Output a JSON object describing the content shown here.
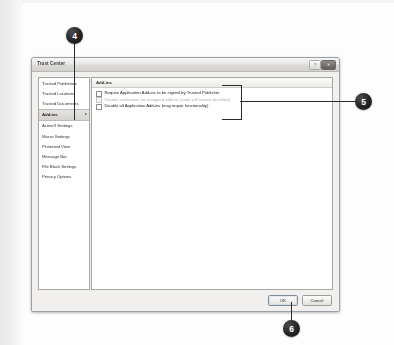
{
  "page": {
    "background_color": "#fdfdfd",
    "margin_band_color": "#e8e8e8"
  },
  "dialog": {
    "title": "Trust Center",
    "title_bar": {
      "help_button_label": "?",
      "close_button_label": "✕"
    },
    "sidebar": {
      "items": [
        {
          "label": "Trusted Publishers",
          "selected": false
        },
        {
          "label": "Trusted Locations",
          "selected": false
        },
        {
          "label": "Trusted Documents",
          "selected": false
        },
        {
          "label": "Add-ins",
          "selected": true
        },
        {
          "label": "ActiveX Settings",
          "selected": false
        },
        {
          "label": "Macro Settings",
          "selected": false
        },
        {
          "label": "Protected View",
          "selected": false
        },
        {
          "label": "Message Bar",
          "selected": false
        },
        {
          "label": "File Block Settings",
          "selected": false
        },
        {
          "label": "Privacy Options",
          "selected": false
        }
      ]
    },
    "pane": {
      "header": "Add-ins",
      "checkboxes": [
        {
          "label": "Require Application Add-ins to be signed by Trusted Publisher",
          "checked": false,
          "disabled": false
        },
        {
          "label": "Disable notification for unsigned add-ins (code will remain disabled)",
          "checked": false,
          "disabled": true
        },
        {
          "label": "Disable all Application Add-ins (may impair functionality)",
          "checked": false,
          "disabled": false
        }
      ]
    },
    "footer": {
      "ok_label": "OK",
      "cancel_label": "Cancel"
    }
  },
  "callouts": [
    {
      "number": "4",
      "target": "sidebar-item-add-ins"
    },
    {
      "number": "5",
      "target": "checkbox-group"
    },
    {
      "number": "6",
      "target": "ok-button"
    }
  ],
  "colors": {
    "callout_fill": "#1c1c1c",
    "callout_text": "#ffffff",
    "dialog_chrome": "#f1f0ee",
    "selection": "#dcdbd8"
  }
}
